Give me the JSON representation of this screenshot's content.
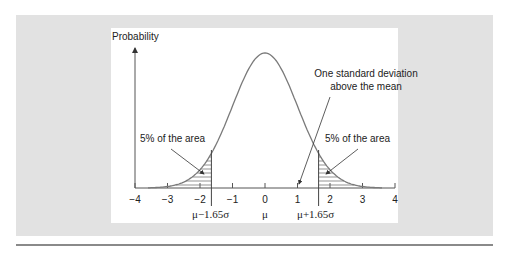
{
  "figure": {
    "y_axis_label": "Probability",
    "annotation_sd": [
      "One standard deviation",
      "above the mean"
    ],
    "left_area_label": "5% of the area",
    "right_area_label": "5% of the area",
    "x_ticks": [
      "−4",
      "−3",
      "−2",
      "−1",
      "0",
      "1",
      "2",
      "3",
      "4"
    ],
    "below_labels": {
      "left": "μ−1.65σ",
      "center": "μ",
      "right": "μ+1.65σ"
    },
    "colors": {
      "panel": "#e2e2e2",
      "curve": "#7a7a7a",
      "axis": "#555555"
    }
  },
  "chart_data": {
    "type": "line",
    "title": "",
    "xlabel": "",
    "ylabel": "Probability",
    "xlim": [
      -4,
      4
    ],
    "x_ticks": [
      -4,
      -3,
      -2,
      -1,
      0,
      1,
      2,
      3,
      4
    ],
    "series": [
      {
        "name": "Standard normal density",
        "mean": 0,
        "sd": 1
      }
    ],
    "shaded_regions": [
      {
        "from": -4,
        "to": -1.65,
        "label": "5% of the area"
      },
      {
        "from": 1.65,
        "to": 4,
        "label": "5% of the area"
      }
    ],
    "vertical_markers": [
      {
        "x": -1.65,
        "label": "μ−1.65σ"
      },
      {
        "x": 0,
        "label": "μ"
      },
      {
        "x": 1.65,
        "label": "μ+1.65σ"
      }
    ],
    "annotations": [
      {
        "x": 1,
        "text": "One standard deviation above the mean"
      }
    ]
  }
}
